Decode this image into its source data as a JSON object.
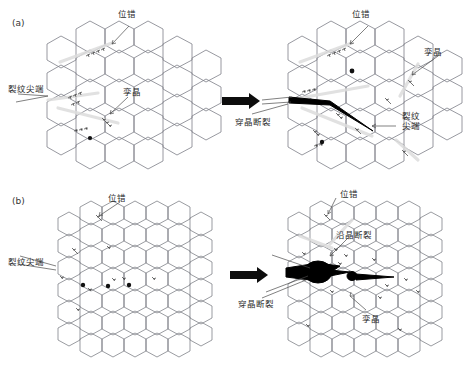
{
  "figure": {
    "type": "schematic-diagram",
    "panels": [
      {
        "id": "a",
        "tag": "(a)",
        "left_state": {
          "name": "initial-state-transgranular",
          "labels": [
            {
              "key": "dislocation",
              "text": "位错"
            },
            {
              "key": "crack_tip",
              "text": "裂纹尖端"
            },
            {
              "key": "twin",
              "text": "孪晶"
            }
          ]
        },
        "right_state": {
          "name": "propagated-state-transgranular",
          "labels": [
            {
              "key": "dislocation",
              "text": "位错"
            },
            {
              "key": "twin",
              "text": "孪晶"
            },
            {
              "key": "transgranular_fracture",
              "text": "穿晶断裂"
            },
            {
              "key": "crack_tip",
              "text": "裂纹尖端"
            }
          ]
        },
        "transition_arrow": "thick-black-right-arrow"
      },
      {
        "id": "b",
        "tag": "(b)",
        "left_state": {
          "name": "initial-state-mixed",
          "labels": [
            {
              "key": "dislocation",
              "text": "位错"
            },
            {
              "key": "crack_tip",
              "text": "裂纹尖端"
            }
          ]
        },
        "right_state": {
          "name": "propagated-state-mixed",
          "labels": [
            {
              "key": "dislocation",
              "text": "位错"
            },
            {
              "key": "intergranular_fracture",
              "text": "沿晶断裂"
            },
            {
              "key": "transgranular_fracture",
              "text": "穿晶断裂"
            },
            {
              "key": "twin",
              "text": "孪晶"
            }
          ]
        },
        "transition_arrow": "thick-black-right-arrow"
      }
    ],
    "colors": {
      "grain_boundary": "#7d7f88",
      "crack": "#000000",
      "arrow": "#0d0d0d",
      "slip_band": "#dcdcdc",
      "label_text": "#2b2b2b",
      "background": "#ffffff"
    },
    "glyphs": {
      "dislocation_symbol": "⊥",
      "void": "filled-black-ellipse"
    }
  }
}
